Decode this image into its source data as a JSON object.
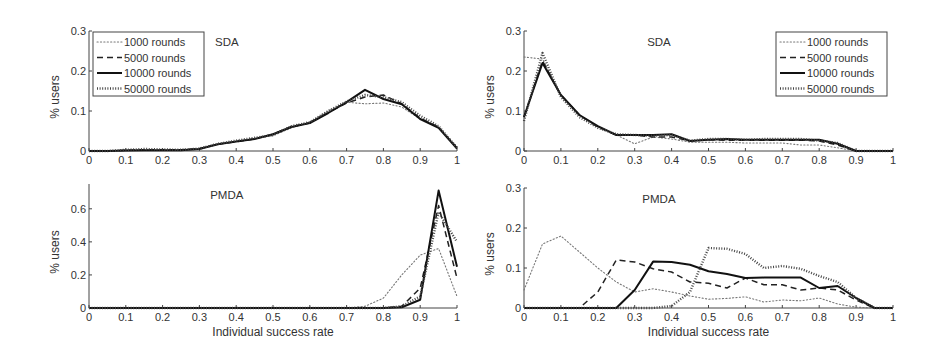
{
  "figure": {
    "xlabel": "Individual success rate",
    "ylabel": "% users"
  },
  "legend": {
    "entries": [
      {
        "label": "1000 rounds",
        "style": "dotted-thin"
      },
      {
        "label": "5000 rounds",
        "style": "dashed"
      },
      {
        "label": "10000 rounds",
        "style": "solid"
      },
      {
        "label": "50000 rounds",
        "style": "dotted-thick"
      }
    ]
  },
  "chart_data": [
    {
      "id": "top-left",
      "type": "line",
      "title": "SDA",
      "xlabel": "",
      "ylabel": "% users",
      "xlim": [
        0,
        1
      ],
      "ylim": [
        0,
        0.3
      ],
      "xticks": [
        "0",
        "0.1",
        "0.2",
        "0.3",
        "0.4",
        "0.5",
        "0.6",
        "0.7",
        "0.8",
        "0.9",
        "1"
      ],
      "yticks": [
        "0",
        "0.1",
        "0.2",
        "0.3"
      ],
      "legend_position": "upper-left",
      "x": [
        0,
        0.05,
        0.1,
        0.15,
        0.2,
        0.25,
        0.3,
        0.35,
        0.4,
        0.45,
        0.5,
        0.55,
        0.6,
        0.65,
        0.7,
        0.75,
        0.8,
        0.85,
        0.9,
        0.95,
        1.0
      ],
      "series": [
        {
          "name": "1000 rounds",
          "values": [
            0,
            0,
            0.002,
            0.004,
            0.003,
            0.003,
            0.006,
            0.016,
            0.024,
            0.031,
            0.038,
            0.058,
            0.072,
            0.1,
            0.122,
            0.118,
            0.12,
            0.11,
            0.08,
            0.06,
            0.01
          ]
        },
        {
          "name": "5000 rounds",
          "values": [
            0,
            0,
            0.002,
            0.003,
            0.003,
            0.003,
            0.006,
            0.017,
            0.023,
            0.03,
            0.042,
            0.061,
            0.07,
            0.096,
            0.12,
            0.135,
            0.14,
            0.118,
            0.082,
            0.06,
            0.008
          ]
        },
        {
          "name": "10000 rounds",
          "values": [
            0,
            0,
            0.001,
            0.002,
            0.002,
            0.002,
            0.005,
            0.017,
            0.024,
            0.03,
            0.042,
            0.06,
            0.07,
            0.095,
            0.122,
            0.153,
            0.13,
            0.117,
            0.08,
            0.058,
            0.006
          ]
        },
        {
          "name": "50000 rounds",
          "values": [
            0,
            0,
            0.003,
            0.005,
            0.004,
            0.003,
            0.006,
            0.018,
            0.026,
            0.033,
            0.04,
            0.062,
            0.072,
            0.1,
            0.124,
            0.14,
            0.135,
            0.122,
            0.088,
            0.062,
            0.008
          ]
        }
      ]
    },
    {
      "id": "top-right",
      "type": "line",
      "title": "SDA",
      "xlabel": "",
      "ylabel": "% users",
      "xlim": [
        0,
        1
      ],
      "ylim": [
        0,
        0.3
      ],
      "xticks": [
        "0",
        "0.1",
        "0.2",
        "0.3",
        "0.4",
        "0.5",
        "0.6",
        "0.7",
        "0.8",
        "0.9",
        "1"
      ],
      "yticks": [
        "0",
        "0.1",
        "0.2",
        "0.3"
      ],
      "legend_position": "upper-right",
      "x": [
        0,
        0.05,
        0.1,
        0.15,
        0.2,
        0.25,
        0.3,
        0.35,
        0.4,
        0.45,
        0.5,
        0.55,
        0.6,
        0.65,
        0.7,
        0.75,
        0.8,
        0.85,
        0.9,
        0.95,
        1.0
      ],
      "series": [
        {
          "name": "1000 rounds",
          "values": [
            0.235,
            0.23,
            0.14,
            0.09,
            0.06,
            0.04,
            0.018,
            0.035,
            0.03,
            0.022,
            0.022,
            0.022,
            0.02,
            0.02,
            0.02,
            0.015,
            0.015,
            0.008,
            0,
            0,
            0
          ]
        },
        {
          "name": "5000 rounds",
          "values": [
            0.085,
            0.225,
            0.14,
            0.09,
            0.06,
            0.04,
            0.04,
            0.035,
            0.035,
            0.025,
            0.028,
            0.027,
            0.027,
            0.027,
            0.027,
            0.027,
            0.025,
            0.015,
            0,
            0,
            0
          ]
        },
        {
          "name": "10000 rounds",
          "values": [
            0.085,
            0.22,
            0.14,
            0.09,
            0.062,
            0.04,
            0.04,
            0.04,
            0.042,
            0.025,
            0.028,
            0.03,
            0.028,
            0.028,
            0.028,
            0.028,
            0.028,
            0.018,
            0,
            0,
            0
          ]
        },
        {
          "name": "50000 rounds",
          "values": [
            0.075,
            0.245,
            0.135,
            0.085,
            0.058,
            0.042,
            0.04,
            0.038,
            0.04,
            0.026,
            0.03,
            0.03,
            0.028,
            0.03,
            0.03,
            0.03,
            0.026,
            0.02,
            0,
            0,
            0
          ]
        }
      ]
    },
    {
      "id": "bottom-left",
      "type": "line",
      "title": "PMDA",
      "xlabel": "Individual success rate",
      "ylabel": "% users",
      "xlim": [
        0,
        1
      ],
      "ylim": [
        0,
        0.75
      ],
      "xticks": [
        "0",
        "0.1",
        "0.2",
        "0.3",
        "0.4",
        "0.5",
        "0.6",
        "0.7",
        "0.8",
        "0.9",
        "1"
      ],
      "yticks": [
        "0",
        "0.2",
        "0.4",
        "0.6"
      ],
      "legend_position": "none",
      "x": [
        0,
        0.05,
        0.1,
        0.15,
        0.2,
        0.25,
        0.3,
        0.35,
        0.4,
        0.45,
        0.5,
        0.55,
        0.6,
        0.65,
        0.7,
        0.75,
        0.8,
        0.85,
        0.9,
        0.95,
        1.0
      ],
      "series": [
        {
          "name": "1000 rounds",
          "values": [
            0,
            0,
            0,
            0,
            0,
            0,
            0,
            0,
            0,
            0,
            0,
            0,
            0,
            0,
            0,
            0.01,
            0.06,
            0.2,
            0.32,
            0.36,
            0.07
          ]
        },
        {
          "name": "5000 rounds",
          "values": [
            0,
            0,
            0,
            0,
            0,
            0,
            0,
            0,
            0,
            0,
            0,
            0,
            0,
            0,
            0,
            0,
            0,
            0.01,
            0.12,
            0.62,
            0.18
          ]
        },
        {
          "name": "10000 rounds",
          "values": [
            0,
            0,
            0,
            0,
            0,
            0,
            0,
            0,
            0,
            0,
            0,
            0,
            0,
            0,
            0,
            0,
            0,
            0.005,
            0.05,
            0.71,
            0.25
          ]
        },
        {
          "name": "50000 rounds",
          "values": [
            0,
            0,
            0,
            0,
            0,
            0,
            0,
            0,
            0,
            0,
            0,
            0,
            0,
            0,
            0,
            0,
            0,
            0.01,
            0.07,
            0.58,
            0.4
          ]
        }
      ]
    },
    {
      "id": "bottom-right",
      "type": "line",
      "title": "PMDA",
      "xlabel": "Individual success rate",
      "ylabel": "% users",
      "xlim": [
        0,
        1
      ],
      "ylim": [
        0,
        0.3
      ],
      "xticks": [
        "0",
        "0.1",
        "0.2",
        "0.3",
        "0.4",
        "0.5",
        "0.6",
        "0.7",
        "0.8",
        "0.9",
        "1"
      ],
      "yticks": [
        "0",
        "0.1",
        "0.2",
        "0.3"
      ],
      "legend_position": "none",
      "x": [
        0,
        0.05,
        0.1,
        0.15,
        0.2,
        0.25,
        0.3,
        0.35,
        0.4,
        0.45,
        0.5,
        0.55,
        0.6,
        0.65,
        0.7,
        0.75,
        0.8,
        0.85,
        0.9,
        0.95,
        1.0
      ],
      "series": [
        {
          "name": "1000 rounds",
          "values": [
            0.045,
            0.16,
            0.18,
            0.14,
            0.1,
            0.065,
            0.04,
            0.048,
            0.04,
            0.03,
            0.022,
            0.024,
            0.028,
            0.015,
            0.02,
            0.018,
            0.025,
            0.01,
            0.002,
            0,
            0
          ]
        },
        {
          "name": "5000 rounds",
          "values": [
            0,
            0,
            0,
            0,
            0.04,
            0.12,
            0.115,
            0.098,
            0.09,
            0.065,
            0.062,
            0.05,
            0.075,
            0.058,
            0.058,
            0.045,
            0.05,
            0.045,
            0.02,
            0,
            0
          ]
        },
        {
          "name": "10000 rounds",
          "values": [
            0,
            0,
            0,
            0,
            0,
            0,
            0.045,
            0.116,
            0.115,
            0.108,
            0.092,
            0.085,
            0.075,
            0.076,
            0.076,
            0.076,
            0.05,
            0.055,
            0.025,
            0,
            0
          ]
        },
        {
          "name": "50000 rounds",
          "values": [
            0,
            0,
            0,
            0,
            0,
            0,
            0,
            0,
            0.005,
            0.04,
            0.15,
            0.148,
            0.135,
            0.1,
            0.105,
            0.098,
            0.08,
            0.065,
            0.025,
            0,
            0
          ]
        }
      ]
    }
  ]
}
